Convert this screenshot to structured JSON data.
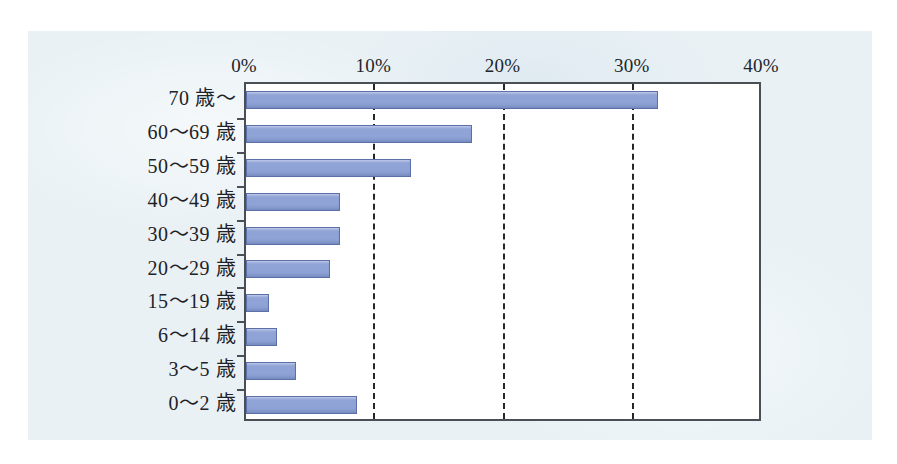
{
  "chart_data": {
    "type": "bar",
    "orientation": "horizontal",
    "title": "",
    "subtitle": "",
    "xlabel": "",
    "ylabel": "",
    "xlim": [
      0,
      40
    ],
    "xticks": [
      0,
      10,
      20,
      30,
      40
    ],
    "xtick_labels": [
      "0%",
      "10%",
      "20%",
      "30%",
      "40%"
    ],
    "xtick_position": "top",
    "grid": "vertical-dashed",
    "legend": "none",
    "categories": [
      "70 歳〜",
      "60〜69 歳",
      "50〜59 歳",
      "40〜49 歳",
      "30〜39 歳",
      "20〜29 歳",
      "15〜19 歳",
      "6〜14 歳",
      "3〜5 歳",
      "0〜2 歳"
    ],
    "values": [
      31.9,
      17.5,
      12.8,
      7.3,
      7.3,
      6.5,
      1.8,
      2.4,
      3.9,
      8.6
    ],
    "value_unit": "%",
    "series": [
      {
        "name": "",
        "values": [
          31.9,
          17.5,
          12.8,
          7.3,
          7.3,
          6.5,
          1.8,
          2.4,
          3.9,
          8.6
        ]
      }
    ]
  },
  "style": {
    "bar_fill": "#8fa3d6",
    "bar_stroke": "#5b6fa8",
    "axis_color": "#4a4f55",
    "grid_color": "#24282c",
    "plot_bg": "#ffffff",
    "page_bg": "#e9f1f5",
    "text_color": "#1d2328"
  }
}
